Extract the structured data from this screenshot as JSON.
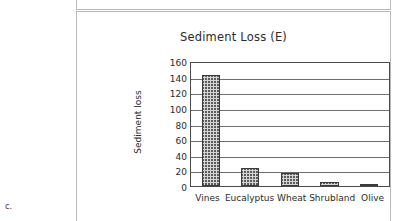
{
  "page": {
    "corner_label": "c."
  },
  "chart_data": {
    "type": "bar",
    "title": "Sediment Loss (E)",
    "xlabel": "",
    "ylabel": "Sediment loss",
    "categories": [
      "Vines",
      "Eucalyptus",
      "Wheat",
      "Shrubland",
      "Olive"
    ],
    "values": [
      142,
      23,
      17,
      5,
      1
    ],
    "ylim": [
      0,
      160
    ],
    "yticks": [
      160,
      140,
      120,
      100,
      80,
      60,
      40,
      20,
      0
    ],
    "grid": true,
    "legend": null,
    "colors": {
      "bar_fill": "#d6d6d6",
      "bar_edge": "#3b3b3b",
      "axis": "#4a4a4a",
      "grid": "#6e6e6e",
      "text": "#2b2b2b"
    }
  }
}
